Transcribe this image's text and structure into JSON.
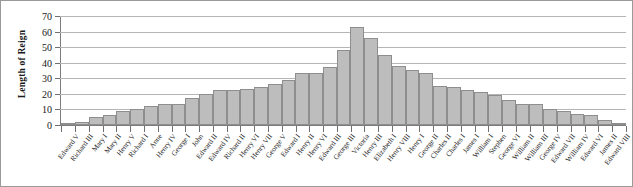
{
  "chart_data": {
    "type": "bar",
    "title": "",
    "subtitle": "",
    "xlabel": "",
    "ylabel": "Length of Reign",
    "ylim": [
      0,
      70
    ],
    "yticks": [
      0,
      10,
      20,
      30,
      40,
      50,
      60,
      70
    ],
    "grid": true,
    "legend": null,
    "bar_fill_color": "#bdbdbd",
    "bar_edge_color": "#8e8e8e",
    "gridline_color": "#b5b5b5",
    "axis_color": "#7d7d7d",
    "categories": [
      "Edward V",
      "Richard III",
      "Mary I",
      "Mary II",
      "Henry V",
      "Richard I",
      "Anne",
      "Henry IV",
      "George I",
      "John",
      "Edward II",
      "Edward IV",
      "Richard II",
      "Henry VI",
      "Henry VII",
      "George V",
      "Edward I",
      "Henry II",
      "Henry VI",
      "Edward III",
      "George III",
      "Victoria",
      "Henry III",
      "Elizabeth I",
      "Henry VIII",
      "Henry I",
      "George II",
      "Charles II",
      "Charles I",
      "James I",
      "William I",
      "Stephen",
      "George VI",
      "William II",
      "William III",
      "George IV",
      "Edward VII",
      "William IV",
      "Edward VI",
      "James II",
      "Edward VIII"
    ],
    "values": [
      1,
      2,
      5,
      6,
      9,
      10,
      12,
      13,
      13,
      17,
      20,
      22,
      22,
      23,
      24,
      26,
      29,
      33,
      33,
      37,
      48,
      63,
      56,
      45,
      38,
      35,
      33,
      25,
      24,
      22,
      21,
      19,
      16,
      13,
      13,
      10,
      9,
      7,
      6,
      3,
      1
    ]
  }
}
